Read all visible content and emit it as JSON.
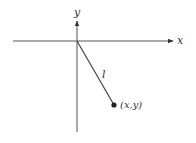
{
  "diagram": {
    "title": "",
    "axes": {
      "x_label": "x",
      "y_label": "y"
    },
    "segment_label": "l",
    "point_label": "(x,y)",
    "colors": {
      "stroke": "#555555",
      "point": "#222222",
      "text": "#333333"
    }
  }
}
